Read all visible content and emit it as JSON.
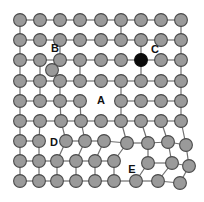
{
  "figure": {
    "type": "lattice-defect-diagram",
    "width": 204,
    "height": 202,
    "background_color": "#ffffff"
  },
  "lattice": {
    "rows": 9,
    "cols": 9,
    "origin_x": 20,
    "origin_y": 20,
    "spacing_x": 20.1,
    "spacing_y": 20.1,
    "atom_radius": 6.4,
    "atom_color": "#9a9a9a",
    "atom_stroke_color": "#4a4a4a",
    "bond_color": "#6f6f6f",
    "impurity_color": "#0b0b0b"
  },
  "atoms": [
    {
      "id": "r1c1",
      "row": 1,
      "col": 1,
      "x": 20,
      "y": 20,
      "kind": "host"
    },
    {
      "id": "r1c2",
      "row": 1,
      "col": 2,
      "x": 40,
      "y": 20,
      "kind": "host"
    },
    {
      "id": "r1c3",
      "row": 1,
      "col": 3,
      "x": 60,
      "y": 20,
      "kind": "host"
    },
    {
      "id": "r1c4",
      "row": 1,
      "col": 4,
      "x": 80,
      "y": 20,
      "kind": "host"
    },
    {
      "id": "r1c5",
      "row": 1,
      "col": 5,
      "x": 101,
      "y": 20,
      "kind": "host"
    },
    {
      "id": "r1c6",
      "row": 1,
      "col": 6,
      "x": 121,
      "y": 20,
      "kind": "host"
    },
    {
      "id": "r1c7",
      "row": 1,
      "col": 7,
      "x": 141,
      "y": 20,
      "kind": "host"
    },
    {
      "id": "r1c8",
      "row": 1,
      "col": 8,
      "x": 161,
      "y": 20,
      "kind": "host"
    },
    {
      "id": "r1c9",
      "row": 1,
      "col": 9,
      "x": 181,
      "y": 20,
      "kind": "host"
    },
    {
      "id": "r2c1",
      "row": 2,
      "col": 1,
      "x": 20,
      "y": 40,
      "kind": "host"
    },
    {
      "id": "r2c2",
      "row": 2,
      "col": 2,
      "x": 40,
      "y": 40,
      "kind": "host"
    },
    {
      "id": "r2c3",
      "row": 2,
      "col": 3,
      "x": 60,
      "y": 40,
      "kind": "host"
    },
    {
      "id": "r2c4",
      "row": 2,
      "col": 4,
      "x": 80,
      "y": 40,
      "kind": "host"
    },
    {
      "id": "r2c5",
      "row": 2,
      "col": 5,
      "x": 101,
      "y": 40,
      "kind": "host"
    },
    {
      "id": "r2c6",
      "row": 2,
      "col": 6,
      "x": 121,
      "y": 40,
      "kind": "host"
    },
    {
      "id": "r2c7",
      "row": 2,
      "col": 7,
      "x": 141,
      "y": 40,
      "kind": "host"
    },
    {
      "id": "r2c8",
      "row": 2,
      "col": 8,
      "x": 161,
      "y": 40,
      "kind": "host"
    },
    {
      "id": "r2c9",
      "row": 2,
      "col": 9,
      "x": 181,
      "y": 40,
      "kind": "host"
    },
    {
      "id": "r3c1",
      "row": 3,
      "col": 1,
      "x": 20,
      "y": 60,
      "kind": "host"
    },
    {
      "id": "r3c2",
      "row": 3,
      "col": 2,
      "x": 40,
      "y": 60,
      "kind": "host"
    },
    {
      "id": "r3c3",
      "row": 3,
      "col": 3,
      "x": 60,
      "y": 60,
      "kind": "host"
    },
    {
      "id": "r3c4",
      "row": 3,
      "col": 4,
      "x": 80,
      "y": 60,
      "kind": "host"
    },
    {
      "id": "r3c5",
      "row": 3,
      "col": 5,
      "x": 101,
      "y": 60,
      "kind": "host"
    },
    {
      "id": "r3c6",
      "row": 3,
      "col": 6,
      "x": 121,
      "y": 60,
      "kind": "host"
    },
    {
      "id": "r3c7",
      "row": 3,
      "col": 7,
      "x": 141,
      "y": 60,
      "kind": "impurity"
    },
    {
      "id": "r3c8",
      "row": 3,
      "col": 8,
      "x": 161,
      "y": 60,
      "kind": "host"
    },
    {
      "id": "r3c9",
      "row": 3,
      "col": 9,
      "x": 181,
      "y": 60,
      "kind": "host"
    },
    {
      "id": "r4c1",
      "row": 4,
      "col": 1,
      "x": 20,
      "y": 81,
      "kind": "host"
    },
    {
      "id": "r4c2",
      "row": 4,
      "col": 2,
      "x": 40,
      "y": 81,
      "kind": "host"
    },
    {
      "id": "r4c3",
      "row": 4,
      "col": 3,
      "x": 60,
      "y": 81,
      "kind": "host"
    },
    {
      "id": "r4c4",
      "row": 4,
      "col": 4,
      "x": 80,
      "y": 81,
      "kind": "host"
    },
    {
      "id": "r4c5",
      "row": 4,
      "col": 5,
      "x": 101,
      "y": 81,
      "kind": "host"
    },
    {
      "id": "r4c6",
      "row": 4,
      "col": 6,
      "x": 121,
      "y": 81,
      "kind": "host"
    },
    {
      "id": "r4c7",
      "row": 4,
      "col": 7,
      "x": 141,
      "y": 81,
      "kind": "host"
    },
    {
      "id": "r4c8",
      "row": 4,
      "col": 8,
      "x": 161,
      "y": 81,
      "kind": "host"
    },
    {
      "id": "r4c9",
      "row": 4,
      "col": 9,
      "x": 181,
      "y": 81,
      "kind": "host"
    },
    {
      "id": "r5c1",
      "row": 5,
      "col": 1,
      "x": 20,
      "y": 101,
      "kind": "host"
    },
    {
      "id": "r5c2",
      "row": 5,
      "col": 2,
      "x": 40,
      "y": 101,
      "kind": "host"
    },
    {
      "id": "r5c3",
      "row": 5,
      "col": 3,
      "x": 60,
      "y": 101,
      "kind": "host"
    },
    {
      "id": "r5c4",
      "row": 5,
      "col": 4,
      "x": 80,
      "y": 101,
      "kind": "host"
    },
    {
      "id": "r5c6",
      "row": 5,
      "col": 6,
      "x": 121,
      "y": 101,
      "kind": "host"
    },
    {
      "id": "r5c7",
      "row": 5,
      "col": 7,
      "x": 141,
      "y": 101,
      "kind": "host"
    },
    {
      "id": "r5c8",
      "row": 5,
      "col": 8,
      "x": 161,
      "y": 101,
      "kind": "host"
    },
    {
      "id": "r5c9",
      "row": 5,
      "col": 9,
      "x": 181,
      "y": 101,
      "kind": "host"
    },
    {
      "id": "r6c1",
      "row": 6,
      "col": 1,
      "x": 20,
      "y": 121,
      "kind": "host"
    },
    {
      "id": "r6c2",
      "row": 6,
      "col": 2,
      "x": 40,
      "y": 121,
      "kind": "host"
    },
    {
      "id": "r6c3",
      "row": 6,
      "col": 3,
      "x": 61,
      "y": 121,
      "kind": "host"
    },
    {
      "id": "r6c4",
      "row": 6,
      "col": 4,
      "x": 81,
      "y": 121,
      "kind": "host"
    },
    {
      "id": "r6c5",
      "row": 6,
      "col": 5,
      "x": 101,
      "y": 121,
      "kind": "host"
    },
    {
      "id": "r6c6",
      "row": 6,
      "col": 6,
      "x": 121,
      "y": 121,
      "kind": "host"
    },
    {
      "id": "r6c7",
      "row": 6,
      "col": 7,
      "x": 141,
      "y": 121,
      "kind": "host"
    },
    {
      "id": "r6c8",
      "row": 6,
      "col": 8,
      "x": 161,
      "y": 121,
      "kind": "host"
    },
    {
      "id": "r6c9",
      "row": 6,
      "col": 9,
      "x": 181,
      "y": 121,
      "kind": "host"
    },
    {
      "id": "r7c1",
      "row": 7,
      "col": 1,
      "x": 20,
      "y": 141,
      "kind": "host"
    },
    {
      "id": "r7c2",
      "row": 7,
      "col": 2,
      "x": 39,
      "y": 141,
      "kind": "host"
    },
    {
      "id": "r7c3",
      "row": 7,
      "col": 3,
      "x": 66,
      "y": 141,
      "kind": "host"
    },
    {
      "id": "r7c4",
      "row": 7,
      "col": 4,
      "x": 85,
      "y": 141,
      "kind": "host"
    },
    {
      "id": "r7c5",
      "row": 7,
      "col": 5,
      "x": 104,
      "y": 141,
      "kind": "host"
    },
    {
      "id": "r7c6",
      "row": 7,
      "col": 6,
      "x": 127,
      "y": 143,
      "kind": "host"
    },
    {
      "id": "r7c7",
      "row": 7,
      "col": 7,
      "x": 148,
      "y": 143,
      "kind": "host"
    },
    {
      "id": "r7c8",
      "row": 7,
      "col": 8,
      "x": 168,
      "y": 142,
      "kind": "host"
    },
    {
      "id": "r7c9",
      "row": 7,
      "col": 9,
      "x": 186,
      "y": 145,
      "kind": "host"
    },
    {
      "id": "r8c1",
      "row": 8,
      "col": 1,
      "x": 20,
      "y": 161,
      "kind": "host"
    },
    {
      "id": "r8c2",
      "row": 8,
      "col": 2,
      "x": 39,
      "y": 161,
      "kind": "host"
    },
    {
      "id": "r8c3",
      "row": 8,
      "col": 3,
      "x": 57,
      "y": 161,
      "kind": "host"
    },
    {
      "id": "r8c4",
      "row": 8,
      "col": 4,
      "x": 76,
      "y": 161,
      "kind": "host"
    },
    {
      "id": "r8c5",
      "row": 8,
      "col": 5,
      "x": 95,
      "y": 161,
      "kind": "host"
    },
    {
      "id": "r8c6",
      "row": 8,
      "col": 6,
      "x": 114,
      "y": 161,
      "kind": "host"
    },
    {
      "id": "r8c7",
      "row": 8,
      "col": 7,
      "x": 148,
      "y": 163,
      "kind": "host"
    },
    {
      "id": "r8c8",
      "row": 8,
      "col": 8,
      "x": 172,
      "y": 163,
      "kind": "host"
    },
    {
      "id": "r8c9",
      "row": 8,
      "col": 9,
      "x": 189,
      "y": 166,
      "kind": "host"
    },
    {
      "id": "r9c1",
      "row": 9,
      "col": 1,
      "x": 20,
      "y": 181,
      "kind": "host"
    },
    {
      "id": "r9c2",
      "row": 9,
      "col": 2,
      "x": 39,
      "y": 181,
      "kind": "host"
    },
    {
      "id": "r9c3",
      "row": 9,
      "col": 3,
      "x": 57,
      "y": 181,
      "kind": "host"
    },
    {
      "id": "r9c4",
      "row": 9,
      "col": 4,
      "x": 76,
      "y": 181,
      "kind": "host"
    },
    {
      "id": "r9c5",
      "row": 9,
      "col": 5,
      "x": 95,
      "y": 181,
      "kind": "host"
    },
    {
      "id": "r9c6",
      "row": 9,
      "col": 6,
      "x": 114,
      "y": 181,
      "kind": "host"
    },
    {
      "id": "r9c7",
      "row": 9,
      "col": 7,
      "x": 136,
      "y": 181,
      "kind": "host"
    },
    {
      "id": "r9c8",
      "row": 9,
      "col": 8,
      "x": 158,
      "y": 181,
      "kind": "host"
    },
    {
      "id": "r9c9",
      "row": 9,
      "col": 9,
      "x": 180,
      "y": 183,
      "kind": "host"
    },
    {
      "id": "interstitial-B",
      "row": 0,
      "col": 0,
      "x": 52,
      "y": 70,
      "kind": "interstitial"
    }
  ],
  "bonds": [
    {
      "from": "r1c1",
      "to": "r1c2"
    },
    {
      "from": "r1c2",
      "to": "r1c3"
    },
    {
      "from": "r1c3",
      "to": "r1c4"
    },
    {
      "from": "r1c4",
      "to": "r1c5"
    },
    {
      "from": "r1c5",
      "to": "r1c6"
    },
    {
      "from": "r1c6",
      "to": "r1c7"
    },
    {
      "from": "r1c7",
      "to": "r1c8"
    },
    {
      "from": "r1c8",
      "to": "r1c9"
    },
    {
      "from": "r2c1",
      "to": "r2c2"
    },
    {
      "from": "r2c2",
      "to": "r2c3"
    },
    {
      "from": "r2c3",
      "to": "r2c4"
    },
    {
      "from": "r2c4",
      "to": "r2c5"
    },
    {
      "from": "r2c5",
      "to": "r2c6"
    },
    {
      "from": "r2c6",
      "to": "r2c7"
    },
    {
      "from": "r2c7",
      "to": "r2c8"
    },
    {
      "from": "r2c8",
      "to": "r2c9"
    },
    {
      "from": "r3c1",
      "to": "r3c2"
    },
    {
      "from": "r3c2",
      "to": "r3c3"
    },
    {
      "from": "r3c3",
      "to": "r3c4"
    },
    {
      "from": "r3c4",
      "to": "r3c5"
    },
    {
      "from": "r3c5",
      "to": "r3c6"
    },
    {
      "from": "r3c6",
      "to": "r3c7"
    },
    {
      "from": "r3c7",
      "to": "r3c8"
    },
    {
      "from": "r3c8",
      "to": "r3c9"
    },
    {
      "from": "r4c1",
      "to": "r4c2"
    },
    {
      "from": "r4c2",
      "to": "r4c3"
    },
    {
      "from": "r4c3",
      "to": "r4c4"
    },
    {
      "from": "r4c4",
      "to": "r4c5"
    },
    {
      "from": "r4c5",
      "to": "r4c6"
    },
    {
      "from": "r4c6",
      "to": "r4c7"
    },
    {
      "from": "r4c7",
      "to": "r4c8"
    },
    {
      "from": "r4c8",
      "to": "r4c9"
    },
    {
      "from": "r5c1",
      "to": "r5c2"
    },
    {
      "from": "r5c2",
      "to": "r5c3"
    },
    {
      "from": "r5c3",
      "to": "r5c4"
    },
    {
      "from": "r5c6",
      "to": "r5c7"
    },
    {
      "from": "r5c7",
      "to": "r5c8"
    },
    {
      "from": "r5c8",
      "to": "r5c9"
    },
    {
      "from": "r6c1",
      "to": "r6c2"
    },
    {
      "from": "r6c2",
      "to": "r6c3"
    },
    {
      "from": "r6c3",
      "to": "r6c4"
    },
    {
      "from": "r6c4",
      "to": "r6c5"
    },
    {
      "from": "r6c5",
      "to": "r6c6"
    },
    {
      "from": "r6c6",
      "to": "r6c7"
    },
    {
      "from": "r6c7",
      "to": "r6c8"
    },
    {
      "from": "r6c8",
      "to": "r6c9"
    },
    {
      "from": "r7c1",
      "to": "r7c2"
    },
    {
      "from": "r7c3",
      "to": "r7c4"
    },
    {
      "from": "r7c4",
      "to": "r7c5"
    },
    {
      "from": "r7c5",
      "to": "r7c6"
    },
    {
      "from": "r7c6",
      "to": "r7c7"
    },
    {
      "from": "r7c7",
      "to": "r7c8"
    },
    {
      "from": "r7c8",
      "to": "r7c9"
    },
    {
      "from": "r8c1",
      "to": "r8c2"
    },
    {
      "from": "r8c2",
      "to": "r8c3"
    },
    {
      "from": "r8c3",
      "to": "r8c4"
    },
    {
      "from": "r8c4",
      "to": "r8c5"
    },
    {
      "from": "r8c5",
      "to": "r8c6"
    },
    {
      "from": "r8c7",
      "to": "r8c8"
    },
    {
      "from": "r8c8",
      "to": "r8c9"
    },
    {
      "from": "r9c1",
      "to": "r9c2"
    },
    {
      "from": "r9c2",
      "to": "r9c3"
    },
    {
      "from": "r9c3",
      "to": "r9c4"
    },
    {
      "from": "r9c4",
      "to": "r9c5"
    },
    {
      "from": "r9c5",
      "to": "r9c6"
    },
    {
      "from": "r9c6",
      "to": "r9c7"
    },
    {
      "from": "r9c7",
      "to": "r9c8"
    },
    {
      "from": "r9c8",
      "to": "r9c9"
    },
    {
      "from": "r1c1",
      "to": "r2c1"
    },
    {
      "from": "r1c6",
      "to": "r2c6"
    },
    {
      "from": "r1c9",
      "to": "r2c9"
    },
    {
      "from": "r2c1",
      "to": "r3c1"
    },
    {
      "from": "r2c3",
      "to": "r3c3"
    },
    {
      "from": "r2c7",
      "to": "r3c7"
    },
    {
      "from": "r2c9",
      "to": "r3c9"
    },
    {
      "from": "r3c1",
      "to": "r4c1"
    },
    {
      "from": "r3c2",
      "to": "r4c2"
    },
    {
      "from": "r3c4",
      "to": "r4c4"
    },
    {
      "from": "r3c7",
      "to": "r4c7"
    },
    {
      "from": "r3c9",
      "to": "r4c9"
    },
    {
      "from": "r4c1",
      "to": "r5c1"
    },
    {
      "from": "r4c2",
      "to": "r5c2"
    },
    {
      "from": "r4c3",
      "to": "r5c3"
    },
    {
      "from": "r4c6",
      "to": "r5c6"
    },
    {
      "from": "r4c9",
      "to": "r5c9"
    },
    {
      "from": "r5c1",
      "to": "r6c1"
    },
    {
      "from": "r5c3",
      "to": "r6c3"
    },
    {
      "from": "r5c4",
      "to": "r6c4"
    },
    {
      "from": "r5c6",
      "to": "r6c6"
    },
    {
      "from": "r5c9",
      "to": "r6c9"
    },
    {
      "from": "r6c1",
      "to": "r7c1"
    },
    {
      "from": "r6c2",
      "to": "r7c2"
    },
    {
      "from": "r6c3",
      "to": "r7c3"
    },
    {
      "from": "r6c4",
      "to": "r7c4"
    },
    {
      "from": "r6c6",
      "to": "r7c6"
    },
    {
      "from": "r6c7",
      "to": "r7c7"
    },
    {
      "from": "r6c8",
      "to": "r7c8"
    },
    {
      "from": "r6c9",
      "to": "r7c9"
    },
    {
      "from": "r7c1",
      "to": "r8c1"
    },
    {
      "from": "r7c2",
      "to": "r8c2"
    },
    {
      "from": "r7c3",
      "to": "r8c3"
    },
    {
      "from": "r7c4",
      "to": "r8c4"
    },
    {
      "from": "r7c5",
      "to": "r8c5"
    },
    {
      "from": "r7c6",
      "to": "r8c6"
    },
    {
      "from": "r7c7",
      "to": "r8c7"
    },
    {
      "from": "r7c8",
      "to": "r8c8"
    },
    {
      "from": "r7c9",
      "to": "r8c9"
    },
    {
      "from": "r8c1",
      "to": "r9c1"
    },
    {
      "from": "r8c2",
      "to": "r9c2"
    },
    {
      "from": "r8c3",
      "to": "r9c3"
    },
    {
      "from": "r8c4",
      "to": "r9c4"
    },
    {
      "from": "r8c5",
      "to": "r9c5"
    },
    {
      "from": "r8c6",
      "to": "r9c6"
    },
    {
      "from": "r8c7",
      "to": "r9c7"
    },
    {
      "from": "r8c8",
      "to": "r9c8"
    },
    {
      "from": "r8c9",
      "to": "r9c9"
    },
    {
      "from": "r4c3",
      "to": "interstitial-B"
    }
  ],
  "labels": [
    {
      "id": "label-B",
      "text": "B",
      "x": 55,
      "y": 49
    },
    {
      "id": "label-C",
      "text": "C",
      "x": 155,
      "y": 50
    },
    {
      "id": "label-A",
      "text": "A",
      "x": 101,
      "y": 101
    },
    {
      "id": "label-D",
      "text": "D",
      "x": 54,
      "y": 143
    },
    {
      "id": "label-E",
      "text": "E",
      "x": 132,
      "y": 170
    }
  ]
}
